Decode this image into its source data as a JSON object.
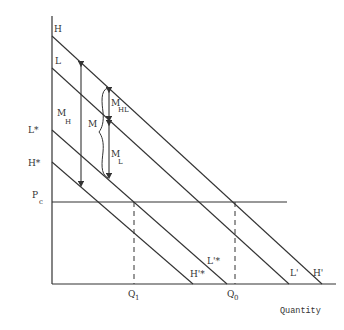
{
  "diagram": {
    "x_axis_label": "Quantity",
    "y_axis_labels": {
      "H": "H",
      "L": "L",
      "L_star": "L*",
      "H_star": "H*",
      "Pc_main": "P",
      "Pc_sub": "c"
    },
    "curve_end_labels": {
      "H_prime_star": "H'*",
      "L_prime_star": "L'*",
      "L_prime": "L'",
      "H_prime": "H'"
    },
    "quantity_labels": {
      "Q1_main": "Q",
      "Q1_sub": "1",
      "Q0_main": "Q",
      "Q0_sub": "0"
    },
    "region_labels": {
      "MH_main": "M",
      "MH_sub": "H",
      "M": "M",
      "MHL_main": "M",
      "MHL_sub": "HL",
      "ML_main": "M",
      "ML_sub": "L"
    },
    "colors": {
      "line": "#333333",
      "background": "#ffffff"
    }
  }
}
